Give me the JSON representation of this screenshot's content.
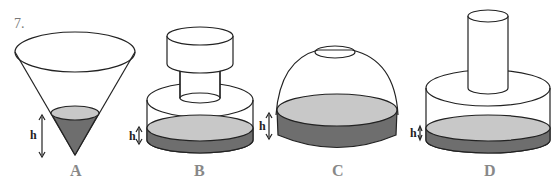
{
  "question_number": "7.",
  "height_label": "h",
  "containers": [
    {
      "id": "A",
      "label": "A",
      "shape": "inverted-cone"
    },
    {
      "id": "B",
      "label": "B",
      "shape": "cylinder-with-stepped-insert"
    },
    {
      "id": "C",
      "label": "C",
      "shape": "dome-with-top-opening"
    },
    {
      "id": "D",
      "label": "D",
      "shape": "cylinder-with-rod-insert"
    }
  ],
  "colors": {
    "liquid_top": "#c8c8c8",
    "liquid_side": "#6e6e6e",
    "outline": "#222222"
  }
}
